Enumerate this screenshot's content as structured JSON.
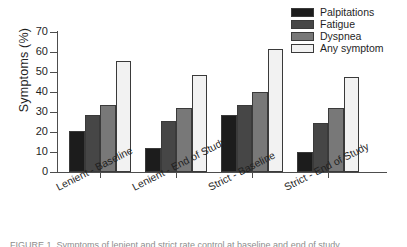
{
  "chart_data": {
    "type": "bar",
    "title": "",
    "xlabel": "",
    "ylabel": "Symptoms (%)",
    "ylim": [
      0,
      70
    ],
    "yticks": [
      0,
      10,
      20,
      30,
      40,
      50,
      60,
      70
    ],
    "grid": false,
    "legend_position": "top-right",
    "categories": [
      "Lenient - Baseline",
      "Lenient - End of Study",
      "Strict - Baseline",
      "Strict - End of Study"
    ],
    "series": [
      {
        "name": "Palpitations",
        "color": "#1c1c1c",
        "values": [
          20.5,
          12.0,
          28.5,
          10.0
        ]
      },
      {
        "name": "Fatigue",
        "color": "#464646",
        "values": [
          28.5,
          25.5,
          33.5,
          24.5
        ]
      },
      {
        "name": "Dyspnea",
        "color": "#787878",
        "values": [
          33.5,
          32.0,
          40.0,
          32.0
        ]
      },
      {
        "name": "Any symptom",
        "color": "#f2f2f2",
        "values": [
          55.5,
          48.5,
          61.5,
          47.5
        ]
      }
    ]
  },
  "legend": {
    "items": [
      {
        "label": "Palpitations"
      },
      {
        "label": "Fatigue"
      },
      {
        "label": "Dyspnea"
      },
      {
        "label": "Any symptom"
      }
    ]
  },
  "axes": {
    "y_title": "Symptoms (%)",
    "y_tick_labels": [
      "0",
      "10",
      "20",
      "30",
      "40",
      "50",
      "60",
      "70"
    ],
    "x_tick_labels": [
      "Lenient - Baseline",
      "Lenient - End of Study",
      "Strict - Baseline",
      "Strict - End of Study"
    ]
  },
  "caption": {
    "sliver_text": "FIGURE 1. Symptoms of lenient and strict rate control at baseline and end of study."
  }
}
